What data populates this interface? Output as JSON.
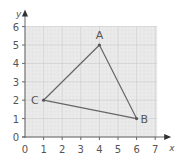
{
  "chart_data": {
    "type": "scatter",
    "title": "",
    "xlabel": "x",
    "ylabel": "y",
    "xlim": [
      0,
      7
    ],
    "ylim": [
      0,
      6
    ],
    "x_ticks": [
      "0",
      "1",
      "2",
      "3",
      "4",
      "5",
      "6",
      "7"
    ],
    "y_ticks": [
      "0",
      "1",
      "2",
      "3",
      "4",
      "5",
      "6"
    ],
    "grid": true,
    "points": [
      {
        "label": "A",
        "x": 4,
        "y": 5
      },
      {
        "label": "B",
        "x": 6,
        "y": 1
      },
      {
        "label": "C",
        "x": 1,
        "y": 2
      }
    ],
    "polygon": [
      "A",
      "B",
      "C"
    ],
    "colors": {
      "grid_bg": "#ebebeb",
      "grid_line": "#d8d8d8",
      "axis": "#666666",
      "triangle": "#666666"
    }
  }
}
